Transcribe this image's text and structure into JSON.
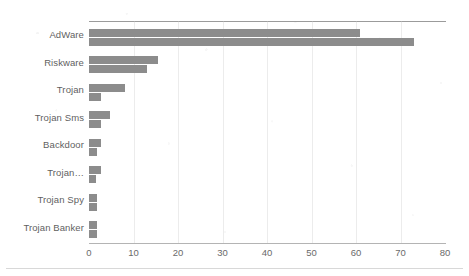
{
  "chart_data": {
    "type": "bar",
    "orientation": "horizontal",
    "title": "",
    "subtitle": "",
    "xlabel": "",
    "ylabel": "",
    "xlim": [
      0,
      80
    ],
    "ylim": null,
    "x_ticks": [
      0,
      10,
      20,
      30,
      40,
      50,
      60,
      70,
      80
    ],
    "x_tick_labels": [
      "0",
      "10",
      "20",
      "30",
      "40",
      "50",
      "60",
      "70",
      "80"
    ],
    "grid": false,
    "legend": null,
    "legend_position": "none",
    "bar_color": "#8c8c8c",
    "categories": [
      "AdWare",
      "Riskware",
      "Trojan",
      "Trojan Sms",
      "Backdoor",
      "Trojan…",
      "Trojan Spy",
      "Trojan Banker"
    ],
    "series": [
      {
        "name": "Series 1",
        "color": "#8c8c8c",
        "values": [
          61.0,
          15.5,
          8.0,
          4.8,
          2.7,
          2.6,
          1.8,
          1.7
        ]
      },
      {
        "name": "Series 2",
        "color": "#8c8c8c",
        "values": [
          73.0,
          13.0,
          2.7,
          2.7,
          1.8,
          1.6,
          1.8,
          1.7
        ]
      }
    ]
  },
  "axis": {
    "top_rule_color": "#9b9b9b",
    "bottom_rule_color": "#b4b4b4"
  }
}
